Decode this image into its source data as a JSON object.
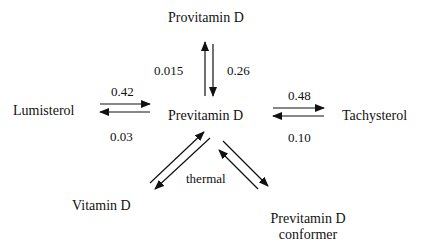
{
  "diagram": {
    "type": "reaction-scheme",
    "center_node": "Previtamin D",
    "nodes": {
      "provitamin_d": "Provitamin D",
      "previtamin_d": "Previtamin D",
      "lumisterol": "Lumisterol",
      "tachysterol": "Tachysterol",
      "vitamin_d": "Vitamin D",
      "previtamin_d_conformer_line1": "Previtamin D",
      "previtamin_d_conformer_line2": "conformer"
    },
    "edges": [
      {
        "from": "Previtamin D",
        "to": "Provitamin D",
        "label": "0.015"
      },
      {
        "from": "Provitamin D",
        "to": "Previtamin D",
        "label": "0.26"
      },
      {
        "from": "Lumisterol",
        "to": "Previtamin D",
        "label": "0.42"
      },
      {
        "from": "Previtamin D",
        "to": "Lumisterol",
        "label": "0.03"
      },
      {
        "from": "Previtamin D",
        "to": "Tachysterol",
        "label": "0.48"
      },
      {
        "from": "Tachysterol",
        "to": "Previtamin D",
        "label": "0.10"
      },
      {
        "from": "Vitamin D",
        "to": "Previtamin D",
        "label": "thermal"
      },
      {
        "from": "Previtamin D",
        "to": "Vitamin D",
        "label": "thermal"
      },
      {
        "from": "Previtamin D",
        "to": "Previtamin D conformer",
        "label": ""
      },
      {
        "from": "Previtamin D conformer",
        "to": "Previtamin D",
        "label": ""
      }
    ],
    "rates": {
      "pre_to_pro": "0.015",
      "pro_to_pre": "0.26",
      "lumi_to_pre": "0.42",
      "pre_to_lumi": "0.03",
      "pre_to_tachy": "0.48",
      "tachy_to_pre": "0.10",
      "thermal": "thermal"
    },
    "colors": {
      "ink": "#111111",
      "background": "#ffffff"
    }
  }
}
